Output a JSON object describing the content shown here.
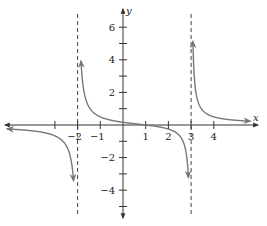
{
  "chart_data": {
    "type": "line",
    "title": "",
    "xlabel": "x",
    "ylabel": "y",
    "xlim": [
      -5.2,
      5.8
    ],
    "ylim": [
      -5.6,
      7.0
    ],
    "x_ticks": [
      -3,
      -2,
      -1,
      1,
      2,
      3,
      4
    ],
    "x_tick_labels": [
      {
        "value": -2,
        "label": "−2"
      },
      {
        "value": -1,
        "label": "−1"
      },
      {
        "value": 1,
        "label": "1"
      },
      {
        "value": 2,
        "label": "2"
      },
      {
        "value": 3,
        "label": "3"
      },
      {
        "value": 4,
        "label": "4"
      }
    ],
    "y_ticks": [
      -5,
      -4,
      -3,
      -2,
      -1,
      1,
      2,
      3,
      4,
      5,
      6
    ],
    "y_tick_labels": [
      {
        "value": 6,
        "label": "6"
      },
      {
        "value": 4,
        "label": "4"
      },
      {
        "value": 2,
        "label": "2"
      },
      {
        "value": -2,
        "label": "−2"
      },
      {
        "value": -4,
        "label": "−4"
      }
    ],
    "grid": false,
    "asymptotes": [
      {
        "type": "vertical",
        "x": -2,
        "style": "dashed"
      },
      {
        "type": "vertical",
        "x": 3,
        "style": "dashed"
      }
    ],
    "function": "(x-1)/((x+2)(x-3))",
    "series": [
      {
        "name": "left-branch",
        "domain": [
          -5.1,
          -2.18
        ],
        "arrows": [
          "start",
          "end"
        ]
      },
      {
        "name": "middle-branch",
        "domain": [
          -1.85,
          2.88
        ],
        "arrows": [
          "start",
          "end"
        ]
      },
      {
        "name": "right-branch",
        "domain": [
          3.08,
          5.6
        ],
        "arrows": [
          "start",
          "end"
        ]
      }
    ],
    "x_intercepts": [
      1
    ],
    "curve_color": "#777777",
    "axis_color": "#333333"
  }
}
